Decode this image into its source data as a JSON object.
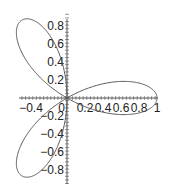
{
  "chart_data": {
    "type": "line",
    "title": "",
    "xlabel": "",
    "ylabel": "",
    "equation": "r = cos(3θ)",
    "theta_range": [
      0,
      3.14159
    ],
    "xlim": [
      -0.5,
      1.0
    ],
    "ylim": [
      -0.9,
      0.9
    ],
    "x_ticks": [
      "-0.4",
      "0",
      "0.2",
      "0.4",
      "0.6",
      "0.8",
      "1"
    ],
    "y_ticks": [
      "0.8",
      "0.6",
      "0.4",
      "0.2",
      "-0.2",
      "-0.4",
      "-0.6",
      "-0.8"
    ],
    "x_tick_values": [
      -0.4,
      0,
      0.2,
      0.4,
      0.6,
      0.8,
      1
    ],
    "y_tick_values": [
      0.8,
      0.6,
      0.4,
      0.2,
      -0.2,
      -0.4,
      -0.6,
      -0.8
    ],
    "petal_tips": [
      {
        "angle_deg": 0,
        "x": 1.0,
        "y": 0.0
      },
      {
        "angle_deg": 120,
        "x": -0.5,
        "y": 0.866
      },
      {
        "angle_deg": 240,
        "x": -0.5,
        "y": -0.866
      }
    ],
    "grid": false,
    "legend": null,
    "line_color": "#555555",
    "axis_color": "#555555"
  },
  "render": {
    "origin_px": [
      67,
      98
    ],
    "scale_px": 90
  }
}
